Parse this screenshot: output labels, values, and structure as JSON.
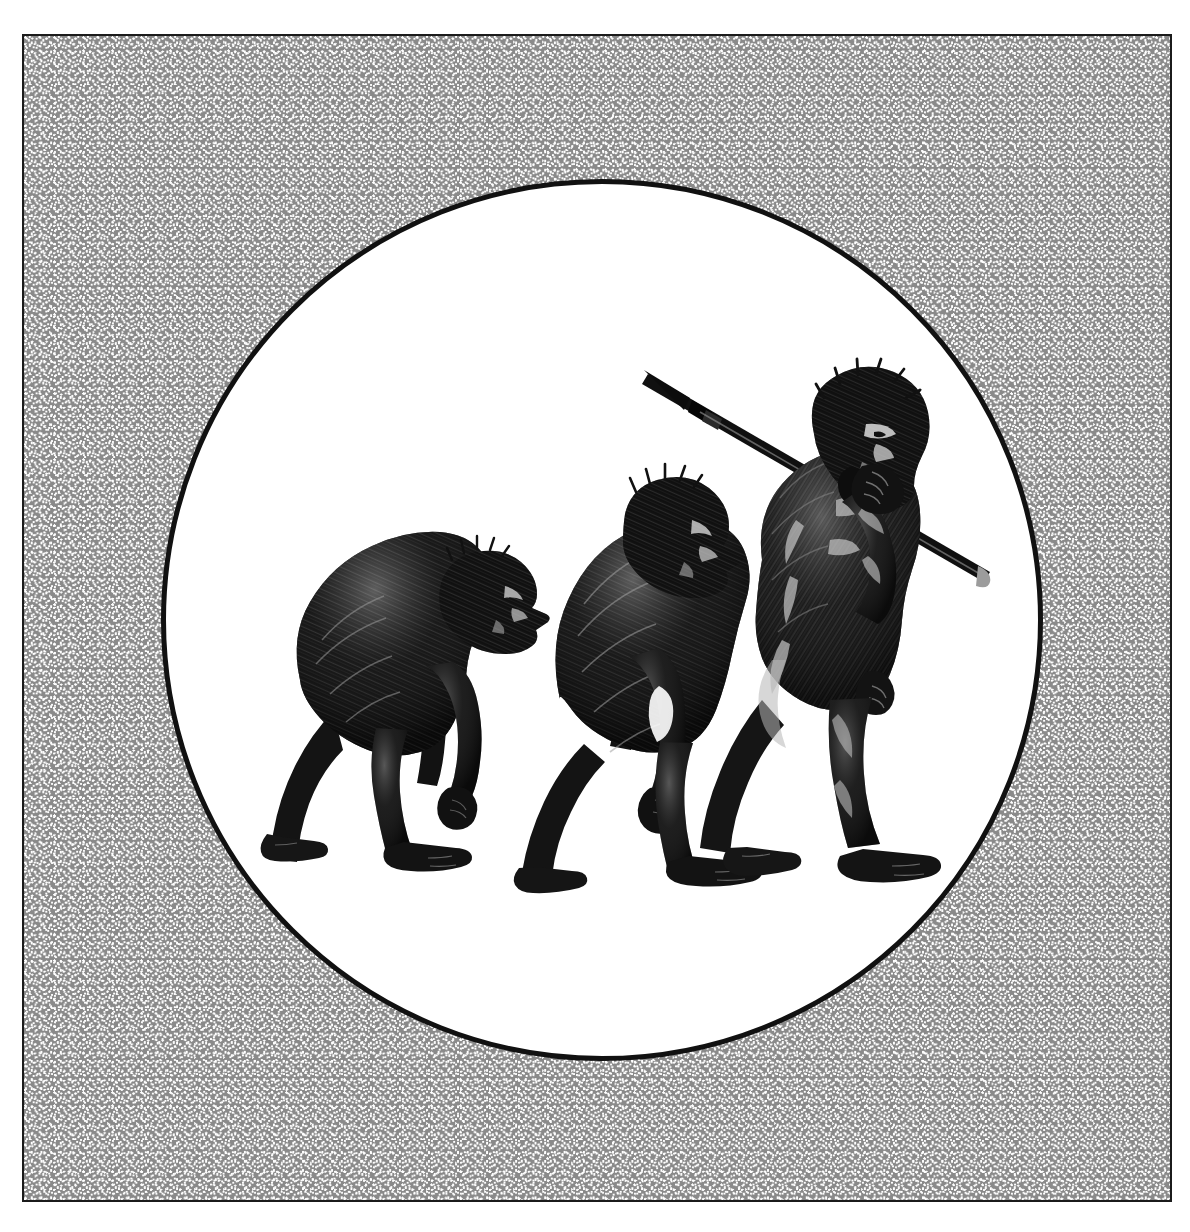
{
  "artwork": {
    "kind": "engraving-illustration",
    "subject": "march-of-progress-human-evolution",
    "title_text": "",
    "caption_text": "",
    "frame": {
      "border_color": "#1b1b1b",
      "fill_color": "#8a8a8a",
      "dot_color": "#ffffff",
      "x": 22,
      "y": 34,
      "width": 1150,
      "height": 1168,
      "texture_name": "stipple-halftone"
    },
    "medallion": {
      "shape": "circle",
      "fill_color": "#ffffff",
      "outline_color": "#111111",
      "center_x": 602,
      "center_y": 620,
      "radius": 440
    },
    "ink_color": "#111111",
    "highlight_color": "#b9b9b9",
    "figures": [
      {
        "id": "figure-1",
        "label": "ape",
        "description": "hunched hairy ape walking on two legs with long arms, head lowered",
        "order": 1,
        "posture": "stooped",
        "carries": "",
        "height_px": 305,
        "baseline_y": 860,
        "x": 265
      },
      {
        "id": "figure-2",
        "label": "early-hominid",
        "description": "semi-upright hairy hominid mid-stride, arms hanging, prognathic face",
        "order": 2,
        "posture": "semi-upright",
        "carries": "",
        "height_px": 380,
        "baseline_y": 868,
        "x": 495
      },
      {
        "id": "figure-3",
        "label": "modern-human",
        "description": "fully upright muscular bearded man striding forward carrying a spear over his right shoulder",
        "order": 3,
        "posture": "upright",
        "carries": "spear",
        "height_px": 500,
        "baseline_y": 875,
        "x": 720
      }
    ],
    "spear": {
      "name": "spear",
      "tip_x": 648,
      "tip_y": 374,
      "butt_x": 990,
      "butt_y": 572,
      "has_lashing": true
    }
  }
}
